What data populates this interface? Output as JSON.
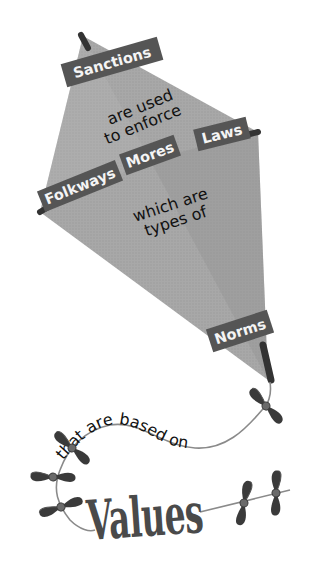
{
  "diagram": {
    "type": "concept-kite",
    "kite": {
      "top_banner": "Sanctions",
      "top_text": [
        "are used",
        "to enforce"
      ],
      "cross_banners": [
        "Folkways",
        "Mores",
        "Laws"
      ],
      "middle_text": [
        "which are",
        "types of"
      ],
      "bottom_banner": "Norms"
    },
    "tail": {
      "connector_text": "that are based on",
      "bottom_label": "Values"
    },
    "colors": {
      "kite_fill": "#a9a9a9",
      "kite_shade": "#8e8e8e",
      "banner": "#555555",
      "dowel": "#333333",
      "bow": "#3a3a3a",
      "string": "#8a8a8a",
      "text": "#111111"
    }
  }
}
